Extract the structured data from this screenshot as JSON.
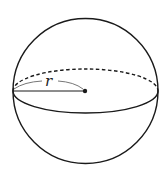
{
  "diagram": {
    "shape": "sphere",
    "radius_label": "r",
    "colors": {
      "stroke": "#1a1a1a",
      "background": "#ffffff",
      "brace": "#555555"
    },
    "elements": [
      {
        "name": "outline",
        "type": "circle"
      },
      {
        "name": "equator-front",
        "type": "solid-arc"
      },
      {
        "name": "equator-back",
        "type": "dashed-arc"
      },
      {
        "name": "radius-line",
        "type": "segment"
      },
      {
        "name": "center-point",
        "type": "dot"
      }
    ]
  }
}
